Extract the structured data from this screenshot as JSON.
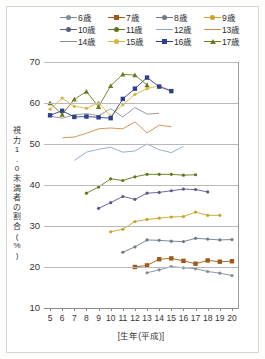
{
  "chart_data": {
    "type": "line",
    "title": "",
    "xlabel": "[生年(平成)]",
    "ylabel": "視力1.0未満者の割合(%)",
    "xlim": [
      4.5,
      20.5
    ],
    "ylim": [
      10,
      70
    ],
    "yticks": [
      10,
      20,
      30,
      40,
      50,
      60,
      70
    ],
    "x": [
      5,
      6,
      7,
      8,
      9,
      10,
      11,
      12,
      13,
      14,
      15,
      16,
      17,
      18,
      19,
      20
    ],
    "grid": true,
    "legend_position": "top",
    "series": [
      {
        "name": "6歳",
        "color": "#7f8c9b",
        "marker": "dot",
        "x": [
          13,
          14,
          15,
          16,
          17,
          18,
          19,
          20
        ],
        "values": [
          18.6,
          19.3,
          20.1,
          19.8,
          19.6,
          18.9,
          18.5,
          17.9
        ]
      },
      {
        "name": "7歳",
        "color": "#9c5a16",
        "marker": "sq",
        "x": [
          12,
          13,
          14,
          15,
          16,
          17,
          18,
          19,
          20
        ],
        "values": [
          20.0,
          20.4,
          21.9,
          22.1,
          21.5,
          20.8,
          21.6,
          21.3,
          21.4
        ]
      },
      {
        "name": "8歳",
        "color": "#6f7a86",
        "marker": "dot",
        "x": [
          11,
          12,
          13,
          14,
          15,
          16,
          17,
          18,
          19,
          20
        ],
        "values": [
          23.6,
          24.9,
          26.6,
          26.5,
          26.3,
          26.2,
          27.0,
          26.8,
          26.6,
          26.7
        ]
      },
      {
        "name": "9歳",
        "color": "#c9a227",
        "marker": "dot",
        "x": [
          10,
          11,
          12,
          13,
          14,
          15,
          16,
          17,
          18,
          19
        ],
        "values": [
          28.6,
          29.2,
          31.1,
          31.6,
          31.9,
          32.2,
          32.3,
          33.4,
          32.6,
          32.6
        ]
      },
      {
        "name": "10歳",
        "color": "#5b5a8c",
        "marker": "dot",
        "x": [
          9,
          10,
          11,
          12,
          13,
          14,
          15,
          16,
          17,
          18
        ],
        "values": [
          34.3,
          35.7,
          37.2,
          36.5,
          38.0,
          38.2,
          38.6,
          39.0,
          38.9,
          38.3
        ]
      },
      {
        "name": "11歳",
        "color": "#60761a",
        "marker": "dot",
        "x": [
          8,
          9,
          10,
          11,
          12,
          13,
          14,
          15,
          16,
          17
        ],
        "values": [
          38.0,
          39.5,
          41.5,
          41.1,
          42.0,
          42.6,
          42.6,
          42.6,
          42.4,
          42.5
        ]
      },
      {
        "name": "12歳",
        "color": "#8da6c6",
        "marker": "none",
        "x": [
          7,
          8,
          9,
          10,
          11,
          12,
          13,
          14,
          15,
          16
        ],
        "values": [
          46.0,
          48.0,
          48.7,
          49.2,
          48.0,
          48.3,
          50.0,
          48.6,
          47.9,
          49.4
        ]
      },
      {
        "name": "13歳",
        "color": "#d08a46",
        "marker": "none",
        "x": [
          6,
          7,
          8,
          9,
          10,
          11,
          12,
          13,
          14,
          15
        ],
        "values": [
          51.5,
          51.7,
          52.6,
          53.7,
          53.9,
          53.7,
          55.4,
          52.7,
          54.6,
          54.2
        ]
      },
      {
        "name": "14歳",
        "color": "#8a8f96",
        "marker": "none",
        "x": [
          5,
          6,
          7,
          8,
          9,
          10,
          11,
          12,
          13,
          14
        ],
        "values": [
          56.8,
          56.3,
          57.1,
          57.4,
          56.9,
          58.6,
          56.6,
          58.9,
          57.3,
          57.5
        ]
      },
      {
        "name": "15歳",
        "color": "#d8b53a",
        "marker": "dot",
        "x": [
          5,
          6,
          7,
          8,
          9,
          10,
          11,
          12,
          13,
          14,
          15
        ],
        "values": [
          58.5,
          61.2,
          59.2,
          58.7,
          60.1,
          56.8,
          59.6,
          62.1,
          63.5,
          64.2,
          63.0
        ]
      },
      {
        "name": "16歳",
        "color": "#2f3f8f",
        "marker": "sq",
        "x": [
          5,
          6,
          7,
          8,
          9,
          10,
          11,
          12,
          13,
          14,
          15
        ],
        "values": [
          57.0,
          58.1,
          56.6,
          56.7,
          56.5,
          56.3,
          61.0,
          63.5,
          66.2,
          64.0,
          62.9
        ]
      },
      {
        "name": "17歳",
        "color": "#6d7a1e",
        "marker": "tri",
        "x": [
          5,
          6,
          7,
          8,
          9,
          10,
          11,
          12,
          13
        ],
        "values": [
          60.0,
          57.2,
          60.9,
          62.8,
          59.1,
          64.2,
          67.0,
          66.8,
          64.4
        ]
      }
    ]
  },
  "legend": {
    "rows": [
      [
        {
          "label": "6歳"
        },
        {
          "label": "7歳"
        },
        {
          "label": "8歳"
        },
        {
          "label": "9歳"
        }
      ],
      [
        {
          "label": "10歳"
        },
        {
          "label": "11歳"
        },
        {
          "label": "12歳"
        },
        {
          "label": "13歳"
        }
      ],
      [
        {
          "label": "14歳"
        },
        {
          "label": "15歳"
        },
        {
          "label": "16歳"
        },
        {
          "label": "17歳"
        }
      ]
    ]
  },
  "axes": {
    "y_title": "視力1.0未満者の割合(%)",
    "x_title": "[生年(平成)]",
    "y_labels": [
      "70",
      "60",
      "50",
      "40",
      "30",
      "20",
      "10"
    ],
    "x_labels": [
      "5",
      "6",
      "7",
      "8",
      "9",
      "10",
      "11",
      "12",
      "13",
      "14",
      "15",
      "16",
      "17",
      "18",
      "19",
      "20"
    ]
  }
}
